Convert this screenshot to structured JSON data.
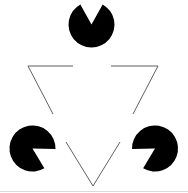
{
  "figure": {
    "canvas": {
      "width": 188,
      "height": 193,
      "background": "#ffffff"
    },
    "colors": {
      "disc_fill": "#000000",
      "outline_stroke": "#4f4f4f",
      "illusory_surface": "#ffffff",
      "baseline_stroke": "#cfcfcf"
    },
    "stroke_widths": {
      "outline": 0.9,
      "baseline": 0.8
    },
    "discs": [
      {
        "name": "top-disc",
        "label": "Top pac-man disc",
        "cx": 91.5,
        "cy": 24.5,
        "r": 23,
        "wedge_bisector_deg": 90,
        "wedge_span_deg": 58,
        "fill": "#000000"
      },
      {
        "name": "bottom-left-disc",
        "label": "Bottom-left pac-man disc",
        "cx": 32.5,
        "cy": 148.5,
        "r": 23,
        "wedge_bisector_deg": 330,
        "wedge_span_deg": 58,
        "fill": "#000000"
      },
      {
        "name": "bottom-right-disc",
        "label": "Bottom-right pac-man disc",
        "cx": 155.0,
        "cy": 148.5,
        "r": 23,
        "wedge_bisector_deg": 210,
        "wedge_span_deg": 58,
        "fill": "#000000"
      }
    ],
    "outline_triangle": {
      "name": "inverted-outline-triangle",
      "label": "Outlined inverted triangle (interrupted)",
      "vertices": [
        {
          "x": 28,
          "y": 66
        },
        {
          "x": 158,
          "y": 66
        },
        {
          "x": 93,
          "y": 186
        }
      ],
      "segments": [
        {
          "name": "top-edge-left-part",
          "x1": 28,
          "y1": 66,
          "x2": 73,
          "y2": 66
        },
        {
          "name": "top-edge-right-part",
          "x1": 111,
          "y1": 66,
          "x2": 158,
          "y2": 66
        },
        {
          "name": "left-edge-upper-part",
          "x1": 28,
          "y1": 66,
          "x2": 53,
          "y2": 114
        },
        {
          "name": "left-edge-lower-part",
          "x1": 66,
          "y1": 142,
          "x2": 93,
          "y2": 186
        },
        {
          "name": "right-edge-upper-part",
          "x1": 158,
          "y1": 66,
          "x2": 133,
          "y2": 114
        },
        {
          "name": "right-edge-lower-part",
          "x1": 120,
          "y1": 142,
          "x2": 93,
          "y2": 186
        }
      ]
    },
    "illusory_triangle": {
      "name": "illusory-upright-triangle",
      "label": "Perceived (subjective) upright white triangle",
      "vertices": [
        {
          "x": 91.5,
          "y": 24.5
        },
        {
          "x": 32.5,
          "y": 148.5
        },
        {
          "x": 155.0,
          "y": 148.5
        }
      ],
      "visible": false
    },
    "baseline": {
      "name": "bottom-baseline",
      "label": "Faint bottom rule",
      "x1": 0,
      "y1": 191.5,
      "x2": 188,
      "y2": 191.5
    }
  }
}
